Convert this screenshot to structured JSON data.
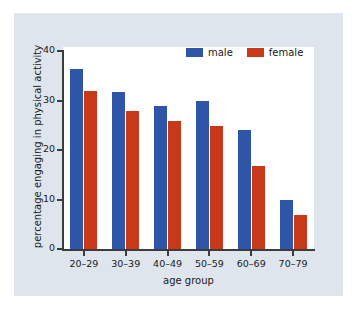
{
  "chart_data": {
    "type": "bar",
    "title": "",
    "xlabel": "age group",
    "ylabel": "percentage engaging in physical activity",
    "categories": [
      "20–29",
      "30–39",
      "40–49",
      "50–59",
      "60–69",
      "70–79"
    ],
    "series": [
      {
        "name": "male",
        "color": "#2e55a8",
        "values": [
          36.3,
          31.7,
          28.9,
          30.0,
          24.0,
          9.9
        ]
      },
      {
        "name": "female",
        "color": "#c8391a",
        "values": [
          31.9,
          27.8,
          25.8,
          24.8,
          16.7,
          6.8
        ]
      }
    ],
    "ylim": [
      0,
      40
    ],
    "yticks": [
      0,
      10,
      20,
      30,
      40
    ],
    "ytick_labels": [
      "0",
      "10",
      "20",
      "30",
      "40"
    ],
    "grid": false,
    "legend_position": "top-right",
    "legend": [
      {
        "label": "male",
        "color": "#2e55a8"
      },
      {
        "label": "female",
        "color": "#c8391a"
      }
    ]
  },
  "figure": {
    "background_color": "#ffffff",
    "panel_color": "#dfe5ec",
    "plot_area_color": "#ffffff",
    "axis_color": "#3c3c3c"
  }
}
